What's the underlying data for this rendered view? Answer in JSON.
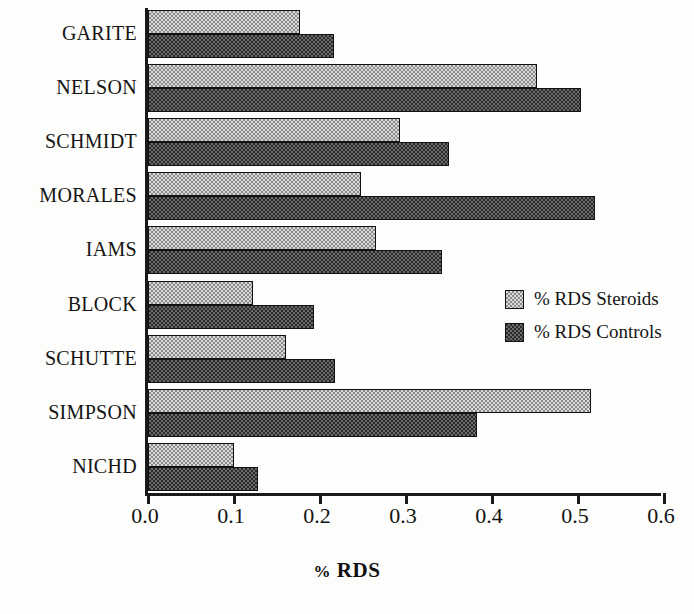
{
  "chart_data": {
    "type": "bar",
    "orientation": "horizontal",
    "title": "",
    "xlabel": "% RDS",
    "ylabel": "",
    "xlim": [
      0.0,
      0.6
    ],
    "xticks": [
      "0.0",
      "0.1",
      "0.2",
      "0.3",
      "0.4",
      "0.5",
      "0.6"
    ],
    "xtick_values": [
      0.0,
      0.1,
      0.2,
      0.3,
      0.4,
      0.5,
      0.6
    ],
    "grid": false,
    "legend_position": "right-middle",
    "categories": [
      "GARITE",
      "NELSON",
      "SCHMIDT",
      "MORALES",
      "IAMS",
      "BLOCK",
      "SCHUTTE",
      "SIMPSON",
      "NICHD"
    ],
    "series": [
      {
        "name": "% RDS Steroids",
        "values": [
          0.177,
          0.452,
          0.293,
          0.248,
          0.265,
          0.122,
          0.16,
          0.515,
          0.1
        ]
      },
      {
        "name": "% RDS Controls",
        "values": [
          0.216,
          0.503,
          0.35,
          0.52,
          0.342,
          0.193,
          0.218,
          0.383,
          0.128
        ]
      }
    ]
  },
  "legend": {
    "items": [
      {
        "label": "% RDS Steroids",
        "swatch": "light-checker"
      },
      {
        "label": "% RDS Controls",
        "swatch": "dark-checker"
      }
    ]
  },
  "axis": {
    "x_title": "% RDS",
    "x_title_pct": "%",
    "x_title_rest": " RDS"
  },
  "colors": {
    "steroids_fill": "#d9d9d9",
    "steroids_pattern": "#8a8a8a",
    "controls_fill": "#2b2b2b",
    "controls_pattern": "#6b6b6b",
    "axis": "#1a1a1a",
    "text": "#141414",
    "background": "#fdfdfb"
  }
}
